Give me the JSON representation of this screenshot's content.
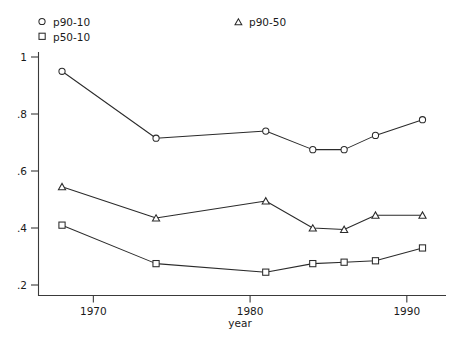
{
  "chart_data": {
    "type": "line",
    "title": "",
    "xlabel": "year",
    "ylabel": "",
    "xlim": [
      1966.5,
      1992.5
    ],
    "ylim": [
      0.2,
      1.0
    ],
    "grid": false,
    "legend_position": "top",
    "xticks": [
      1970,
      1980,
      1990
    ],
    "xtick_labels": [
      "1970",
      "1980",
      "1990"
    ],
    "yticks": [
      0.2,
      0.4,
      0.6,
      0.8,
      1.0
    ],
    "ytick_labels": [
      ".2",
      ".4",
      ".6",
      ".8",
      "1"
    ],
    "x": [
      1968,
      1974,
      1981,
      1984,
      1986,
      1988,
      1991
    ],
    "series": [
      {
        "name": "p90-10",
        "marker": "circle",
        "values": [
          0.95,
          0.715,
          0.74,
          0.675,
          0.675,
          0.725,
          0.78
        ]
      },
      {
        "name": "p50-10",
        "marker": "square",
        "values": [
          0.41,
          0.275,
          0.245,
          0.275,
          0.28,
          0.285,
          0.33
        ]
      },
      {
        "name": "p90-50",
        "marker": "triangle",
        "values": [
          0.545,
          0.435,
          0.495,
          0.4,
          0.395,
          0.445,
          0.445
        ]
      }
    ]
  },
  "legend": {
    "entries": [
      {
        "label": "p90-10",
        "marker": "circle"
      },
      {
        "label": "p50-10",
        "marker": "square"
      },
      {
        "label": "p90-50",
        "marker": "triangle"
      }
    ]
  },
  "axes": {
    "x_title": "year"
  },
  "colors": {
    "line": "#2b2b2b",
    "axis": "#3a3a3a",
    "text": "#1a1a1a",
    "background": "#ffffff",
    "marker_fill": "#ffffff"
  }
}
